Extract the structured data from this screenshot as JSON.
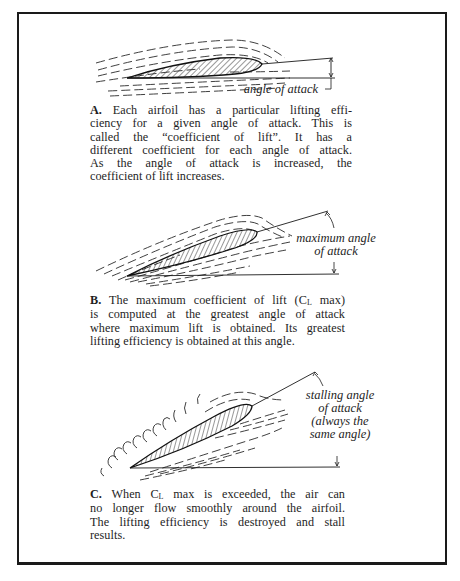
{
  "figure": {
    "panels": [
      {
        "id": "A",
        "diagram_label": "angle of attack",
        "caption_lead": "A.",
        "caption_lines": [
          "Each airfoil has a particular lifting effi-",
          "ciency for a given angle of attack. This is",
          "called the “coefficient of lift”. It has a",
          "different coefficient for each angle of attack.",
          "As the angle of attack is increased, the",
          "coefficient of lift increases."
        ]
      },
      {
        "id": "B",
        "diagram_label_lines": [
          "maximum angle",
          "of attack"
        ],
        "caption_lead": "B.",
        "caption_parts": {
          "pre": "The maximum coefficient of lift (C",
          "sub": "L",
          "post": " max)"
        },
        "caption_lines": [
          "is computed at the greatest angle of attack",
          "where maximum lift is obtained. Its greatest",
          "lifting efficiency is obtained at this angle."
        ]
      },
      {
        "id": "C",
        "diagram_label_lines": [
          "stalling angle",
          "of attack",
          "(always the",
          "same angle)"
        ],
        "caption_lead": "C.",
        "caption_parts": {
          "pre": "When C",
          "sub": "L",
          "post": "  max is exceeded, the air can"
        },
        "caption_lines": [
          "no longer flow smoothly around the airfoil.",
          "The lifting efficiency is destroyed and stall",
          "results."
        ]
      }
    ]
  },
  "colors": {
    "ink": "#1a1a1a",
    "background": "#ffffff"
  }
}
